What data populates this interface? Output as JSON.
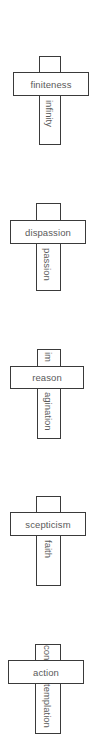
{
  "crosses": [
    {
      "horizontal": "finiteness",
      "vertical_top": "",
      "vertical_bottom": "infinity"
    },
    {
      "horizontal": "dispassion",
      "vertical_top": "",
      "vertical_bottom": "passion"
    },
    {
      "horizontal": "reason",
      "vertical_top": "im",
      "vertical_bottom": "agination"
    },
    {
      "horizontal": "scepticism",
      "vertical_top": "",
      "vertical_bottom": "faith"
    },
    {
      "horizontal": "action",
      "vertical_top": "con",
      "vertical_bottom": "templation"
    }
  ],
  "colors": {
    "stroke": "#3a3a3a",
    "text": "#5a5a5a",
    "background": "#ffffff"
  }
}
